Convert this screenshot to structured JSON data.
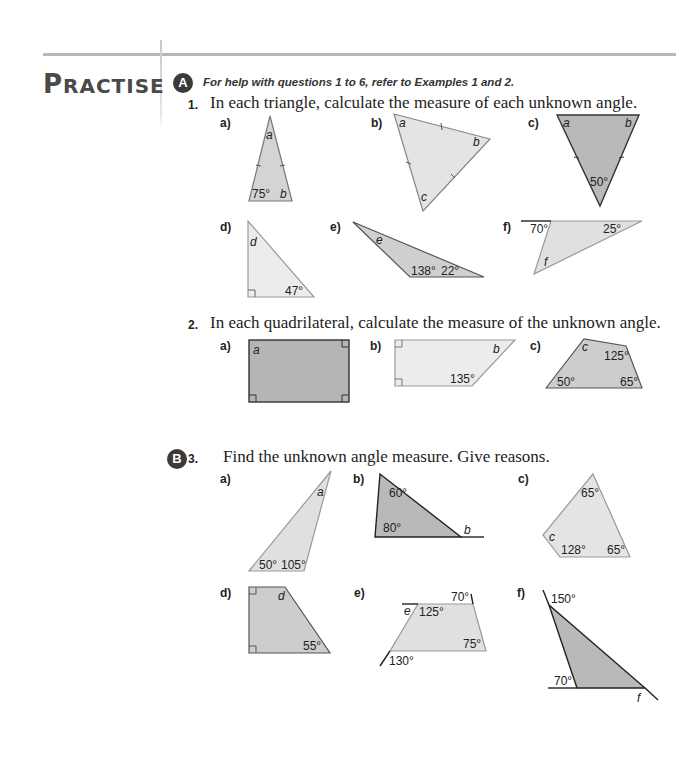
{
  "section": {
    "title_first_letter": "P",
    "title_rest": "RACTISE",
    "level_a_badge": "A",
    "level_b_badge": "B",
    "help_text": "For help with questions 1 to 6, refer to Examples 1 and 2."
  },
  "questions": [
    {
      "number": "1.",
      "text": "In each triangle, calculate the measure of each unknown angle.",
      "parts": [
        {
          "label": "a)",
          "angles": [
            "a",
            "75°",
            "b"
          ]
        },
        {
          "label": "b)",
          "angles": [
            "a",
            "b",
            "c"
          ]
        },
        {
          "label": "c)",
          "angles": [
            "a",
            "b",
            "50°"
          ]
        },
        {
          "label": "d)",
          "angles": [
            "d",
            "47°"
          ]
        },
        {
          "label": "e)",
          "angles": [
            "e",
            "138°",
            "22°"
          ]
        },
        {
          "label": "f)",
          "angles": [
            "70°",
            "25°",
            "f"
          ]
        }
      ]
    },
    {
      "number": "2.",
      "text": "In each quadrilateral, calculate the measure of the unknown angle.",
      "parts": [
        {
          "label": "a)",
          "angles": [
            "a"
          ]
        },
        {
          "label": "b)",
          "angles": [
            "b",
            "135°"
          ]
        },
        {
          "label": "c)",
          "angles": [
            "c",
            "125°",
            "50°",
            "65°"
          ]
        }
      ]
    },
    {
      "number": "3.",
      "text": "Find the unknown angle measure. Give reasons.",
      "parts": [
        {
          "label": "a)",
          "angles": [
            "a",
            "50°",
            "105°"
          ]
        },
        {
          "label": "b)",
          "angles": [
            "60°",
            "80°",
            "b"
          ]
        },
        {
          "label": "c)",
          "angles": [
            "65°",
            "c",
            "128°",
            "65°"
          ]
        },
        {
          "label": "d)",
          "angles": [
            "d",
            "55°"
          ]
        },
        {
          "label": "e)",
          "angles": [
            "70°",
            "e",
            "125°",
            "75°",
            "130°"
          ]
        },
        {
          "label": "f)",
          "angles": [
            "150°",
            "70°",
            "f"
          ]
        }
      ]
    }
  ],
  "colors": {
    "light_fill": "#e6e6e6",
    "mid_fill": "#c9c9c9",
    "dark_fill": "#b5b5b5",
    "badge": "#3a3a3a",
    "rule": "#b8b8b8"
  }
}
